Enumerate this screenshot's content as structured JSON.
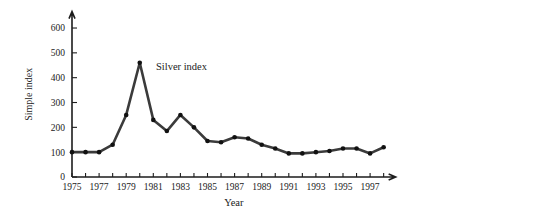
{
  "chart_data": {
    "type": "line",
    "title": "",
    "xlabel": "Year",
    "ylabel": "Simple index",
    "annotation": "Silver index",
    "grid": false,
    "legend": "none",
    "xlim": [
      1975,
      1998
    ],
    "ylim": [
      0,
      650
    ],
    "ytick_values": [
      0,
      100,
      200,
      300,
      400,
      500,
      600
    ],
    "ytick_labels": [
      "0",
      "100",
      "200",
      "300",
      "400",
      "500",
      "600"
    ],
    "xtick_values": [
      1975,
      1976,
      1977,
      1978,
      1979,
      1980,
      1981,
      1982,
      1983,
      1984,
      1985,
      1986,
      1987,
      1988,
      1989,
      1990,
      1991,
      1992,
      1993,
      1994,
      1995,
      1996,
      1997,
      1998
    ],
    "xtick_labels": [
      "1975",
      "",
      "1977",
      "",
      "1979",
      "",
      "1981",
      "",
      "1983",
      "",
      "1985",
      "",
      "1987",
      "",
      "1989",
      "",
      "1991",
      "",
      "1993",
      "",
      "1995",
      "",
      "1997",
      ""
    ],
    "series": [
      {
        "name": "Silver index",
        "x": [
          1975,
          1976,
          1977,
          1978,
          1979,
          1980,
          1981,
          1982,
          1983,
          1984,
          1985,
          1986,
          1987,
          1988,
          1989,
          1990,
          1991,
          1992,
          1993,
          1994,
          1995,
          1996,
          1997,
          1998
        ],
        "values": [
          100,
          100,
          100,
          130,
          250,
          460,
          230,
          185,
          250,
          200,
          145,
          140,
          160,
          155,
          130,
          115,
          95,
          95,
          100,
          105,
          115,
          115,
          95,
          120
        ],
        "color": "#3b3b3b",
        "marker": "circle"
      }
    ]
  }
}
